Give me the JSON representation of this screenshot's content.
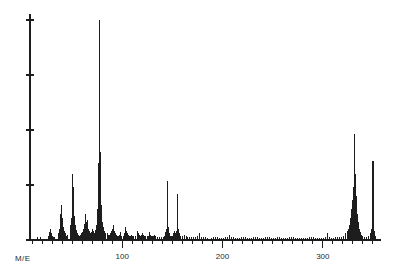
{
  "axis": {
    "x_label": "M/E",
    "x_tick_labels": [
      "100",
      "200",
      "300"
    ],
    "x_tick_values": [
      100,
      200,
      300
    ],
    "y_tick_count": 5
  },
  "chart_data": {
    "type": "bar",
    "title": "",
    "subtitle": "",
    "xlabel": "M/E",
    "ylabel": "",
    "xlim": [
      8,
      358
    ],
    "ylim": [
      0,
      100
    ],
    "grid": false,
    "legend": null,
    "x_tick_labels": [
      "100",
      "200",
      "300"
    ],
    "x_major_ticks": [
      100,
      200,
      300
    ],
    "x_minor_tick_step": 10,
    "y_ticks": [
      0,
      25,
      50,
      75,
      100
    ],
    "base_peak_mz": 77,
    "base_peak_intensity": 100,
    "x": [
      15,
      18,
      26,
      27,
      28,
      29,
      30,
      31,
      32,
      36,
      37,
      38,
      39,
      40,
      41,
      42,
      43,
      44,
      45,
      48,
      49,
      50,
      51,
      52,
      53,
      54,
      55,
      56,
      57,
      58,
      59,
      60,
      61,
      62,
      63,
      64,
      65,
      66,
      67,
      68,
      69,
      70,
      71,
      72,
      73,
      74,
      75,
      76,
      77,
      78,
      79,
      80,
      81,
      82,
      83,
      85,
      86,
      87,
      88,
      89,
      90,
      91,
      92,
      93,
      94,
      95,
      96,
      97,
      98,
      99,
      101,
      102,
      103,
      104,
      105,
      106,
      107,
      108,
      109,
      110,
      111,
      113,
      115,
      116,
      117,
      118,
      119,
      120,
      121,
      122,
      123,
      125,
      126,
      127,
      128,
      129,
      130,
      131,
      132,
      133,
      135,
      137,
      139,
      141,
      142,
      143,
      144,
      145,
      146,
      147,
      148,
      149,
      150,
      151,
      152,
      153,
      154,
      155,
      156,
      157,
      158,
      160,
      162,
      164,
      165,
      167,
      169,
      171,
      173,
      175,
      177,
      179,
      181,
      183,
      185,
      189,
      191,
      193,
      195,
      197,
      199,
      201,
      203,
      205,
      207,
      209,
      211,
      213,
      215,
      217,
      219,
      221,
      223,
      225,
      227,
      229,
      231,
      233,
      235,
      237,
      239,
      241,
      243,
      245,
      247,
      249,
      251,
      253,
      255,
      257,
      259,
      261,
      263,
      265,
      267,
      269,
      271,
      273,
      275,
      277,
      279,
      281,
      283,
      285,
      287,
      289,
      291,
      293,
      295,
      297,
      299,
      301,
      303,
      305,
      307,
      309,
      311,
      313,
      315,
      317,
      319,
      321,
      323,
      325,
      326,
      327,
      328,
      329,
      330,
      331,
      332,
      333,
      334,
      335,
      336,
      337,
      338,
      339,
      340,
      342,
      344,
      346,
      348,
      349,
      350,
      351,
      352,
      353
    ],
    "values": [
      1.5,
      1.2,
      2.0,
      3.5,
      5.0,
      3.0,
      2.0,
      1.5,
      1.2,
      3.0,
      5.0,
      12.0,
      16.0,
      10.0,
      6.0,
      4.0,
      3.0,
      2.0,
      2.5,
      7.0,
      10.0,
      30.0,
      24.0,
      11.0,
      7.0,
      4.5,
      3.0,
      2.5,
      2.0,
      2.5,
      3.0,
      3.5,
      5.0,
      7.5,
      12.0,
      8.0,
      9.0,
      5.0,
      4.0,
      3.0,
      3.5,
      5.0,
      4.0,
      3.0,
      4.5,
      7.0,
      14.0,
      35.0,
      100.0,
      40.0,
      16.0,
      8.0,
      6.0,
      4.0,
      3.0,
      3.0,
      2.5,
      2.5,
      3.0,
      4.0,
      5.0,
      7.0,
      4.0,
      3.0,
      2.5,
      2.0,
      2.0,
      2.5,
      3.5,
      2.0,
      2.0,
      3.0,
      6.0,
      4.0,
      3.0,
      2.5,
      2.0,
      2.0,
      2.5,
      2.0,
      1.8,
      2.0,
      4.0,
      3.0,
      2.5,
      2.0,
      2.5,
      3.0,
      2.5,
      2.0,
      1.8,
      1.8,
      2.0,
      3.5,
      2.5,
      2.0,
      1.8,
      2.0,
      2.5,
      2.0,
      1.5,
      1.5,
      1.5,
      1.5,
      2.0,
      3.5,
      5.0,
      27.0,
      6.0,
      3.0,
      2.0,
      1.8,
      2.0,
      3.0,
      4.0,
      3.0,
      4.0,
      21.0,
      5.0,
      3.0,
      2.0,
      2.0,
      2.5,
      1.8,
      1.5,
      1.5,
      1.2,
      1.2,
      1.5,
      1.8,
      3.0,
      1.5,
      1.2,
      1.2,
      1.0,
      1.0,
      1.2,
      1.5,
      1.2,
      1.0,
      1.0,
      1.0,
      1.2,
      1.5,
      2.5,
      1.5,
      1.2,
      1.0,
      1.0,
      1.0,
      1.2,
      1.5,
      1.2,
      1.0,
      1.0,
      1.0,
      1.2,
      1.5,
      1.2,
      1.0,
      1.0,
      1.0,
      1.2,
      1.5,
      1.2,
      1.0,
      1.0,
      1.0,
      1.2,
      1.2,
      1.0,
      1.0,
      1.0,
      1.0,
      1.2,
      1.5,
      1.2,
      1.0,
      1.0,
      1.0,
      1.0,
      1.0,
      1.0,
      1.0,
      1.2,
      1.5,
      1.2,
      1.0,
      1.0,
      1.0,
      1.0,
      1.0,
      1.2,
      3.0,
      1.5,
      1.0,
      1.0,
      1.2,
      1.5,
      1.2,
      1.5,
      2.0,
      3.0,
      4.0,
      5.0,
      7.0,
      10.0,
      14.0,
      18.0,
      24.0,
      48.0,
      30.0,
      20.0,
      12.0,
      8.0,
      5.0,
      3.5,
      2.5,
      2.0,
      1.5,
      1.5,
      2.0,
      3.0,
      5.0,
      36.0,
      8.0,
      4.0,
      2.0
    ]
  }
}
